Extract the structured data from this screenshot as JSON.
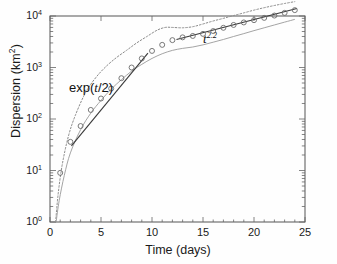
{
  "figure": {
    "background": "#fefefe",
    "frame_color": "#555555",
    "marker_color": "#6b6b6b",
    "line_color": "#4a4a4a",
    "envelope_color": "#8a8a8a"
  },
  "axes": {
    "x_title": "Time (days)",
    "y_title_main": "Dispersion (km",
    "y_title_sup": "2",
    "y_title_close": ")",
    "x_ticks": [
      "0",
      "5",
      "10",
      "15",
      "20",
      "25"
    ],
    "x_tick_values": [
      0,
      5,
      10,
      15,
      20,
      25
    ],
    "y_ticks": [
      "0",
      "1",
      "2",
      "3",
      "4"
    ],
    "y_tick_base": "10",
    "y_tick_values": [
      1,
      10,
      100,
      1000,
      10000
    ]
  },
  "annotations": {
    "exp_prefix": "exp(",
    "exp_var": "t",
    "exp_suffix": "/2)",
    "pow_var": "t",
    "pow_exp": "2.2"
  },
  "chart_data": {
    "type": "scatter",
    "title": "",
    "xlabel": "Time (days)",
    "ylabel": "Dispersion (km^2)",
    "xlim": [
      0,
      25
    ],
    "ylim": [
      1,
      10000
    ],
    "yscale": "log",
    "xscale": "linear",
    "grid": false,
    "legend": "none",
    "x": [
      1,
      2,
      3,
      4,
      5,
      6,
      7,
      8,
      9,
      10,
      11,
      12,
      13,
      14,
      15,
      16,
      17,
      18,
      19,
      20,
      21,
      22,
      23,
      24
    ],
    "y": [
      9,
      36,
      73,
      150,
      250,
      390,
      620,
      1000,
      1500,
      2100,
      2750,
      3400,
      3850,
      4100,
      4500,
      5100,
      5900,
      6700,
      7500,
      8300,
      9200,
      10200,
      11500,
      13000
    ],
    "series": [
      {
        "name": "observed dispersion",
        "style": "open-circles",
        "values": [
          9,
          36,
          73,
          150,
          250,
          390,
          620,
          1000,
          1500,
          2100,
          2750,
          3400,
          3850,
          4100,
          4500,
          5100,
          5900,
          6700,
          7500,
          8300,
          9200,
          10200,
          11500,
          13000
        ]
      },
      {
        "name": "upper envelope",
        "style": "dotted",
        "x": [
          0.55,
          0.8,
          1.2,
          1.8,
          2.5,
          3.5,
          4.5,
          5.5,
          6.5,
          7.5,
          8.5,
          9.5,
          10.5,
          11.3,
          12,
          13,
          14,
          15,
          16,
          17,
          18,
          19,
          20,
          21,
          22,
          23,
          24
        ],
        "values": [
          1,
          3.5,
          13,
          46,
          120,
          330,
          640,
          1050,
          1550,
          2150,
          3000,
          4000,
          5300,
          6000,
          6000,
          5900,
          6200,
          7000,
          8000,
          9000,
          10200,
          11500,
          13000,
          14500,
          16000,
          17500,
          19000
        ]
      },
      {
        "name": "lower envelope",
        "style": "solid-thin",
        "x": [
          0.6,
          0.9,
          1.4,
          2,
          3,
          4,
          5,
          6,
          7,
          8,
          9,
          10,
          11,
          12,
          13,
          14,
          15,
          16,
          17,
          18,
          19,
          20,
          21,
          22,
          23,
          24
        ],
        "values": [
          1,
          2.6,
          8,
          22,
          62,
          130,
          230,
          380,
          580,
          850,
          1150,
          1500,
          1850,
          2150,
          2350,
          2500,
          2750,
          3100,
          3500,
          4000,
          4550,
          5200,
          5900,
          6700,
          7600,
          8600
        ]
      }
    ],
    "fit_lines": [
      {
        "name": "exponential fit",
        "label": "exp(t/2)",
        "formula": "exp(t/2)",
        "x_range": [
          2.1,
          9.6
        ],
        "y_range": [
          30,
          1900
        ]
      },
      {
        "name": "power-law fit",
        "label": "t^2.2",
        "formula": "t^2.2",
        "x_range": [
          12.4,
          24.2
        ],
        "y_range": [
          3500,
          14000
        ]
      }
    ]
  }
}
